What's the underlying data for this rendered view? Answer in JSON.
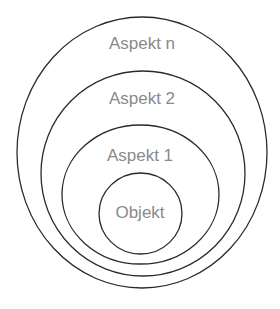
{
  "diagram": {
    "type": "nested-sets",
    "layers": [
      {
        "id": "aspekt-n",
        "label": "Aspekt n"
      },
      {
        "id": "aspekt-2",
        "label": "Aspekt 2"
      },
      {
        "id": "aspekt-1",
        "label": "Aspekt 1"
      },
      {
        "id": "objekt",
        "label": "Objekt"
      }
    ],
    "colors": {
      "stroke": "#2a2a2a",
      "label": "#8a8a8a",
      "background": "#ffffff"
    }
  }
}
